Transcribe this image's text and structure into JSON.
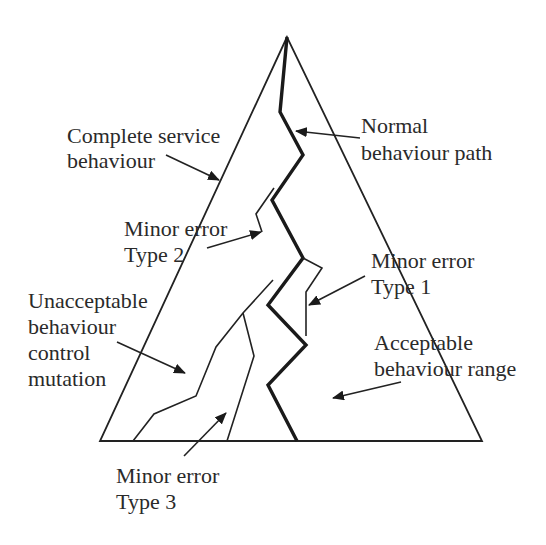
{
  "diagram": {
    "title": "",
    "labels": {
      "complete_service": [
        "Complete service",
        "behaviour"
      ],
      "normal_path": [
        "Normal",
        "behaviour path"
      ],
      "minor_error_type2": [
        "Minor error",
        "Type 2"
      ],
      "minor_error_type1": [
        "Minor error",
        "Type 1"
      ],
      "unacceptable": [
        "Unacceptable",
        "behaviour",
        "control",
        "mutation"
      ],
      "acceptable": [
        "Acceptable",
        "behaviour range"
      ],
      "minor_error_type3": [
        "Minor error",
        "Type 3"
      ]
    },
    "colors": {
      "line": "#1a1a1a",
      "text": "#2a2a2a",
      "background": "#ffffff"
    }
  }
}
